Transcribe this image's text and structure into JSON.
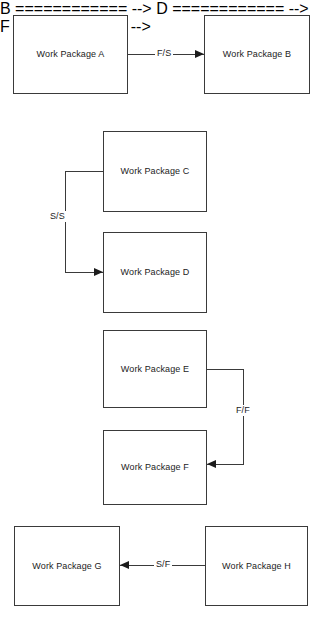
{
  "diagram": {
    "type": "dependency-diagram",
    "background_color": "#ffffff",
    "node_border_color": "#3a3a3a",
    "connector_color": "#3a3a3a",
    "text_color": "#1c1c1c",
    "nodes": [
      {
        "id": "a",
        "label": "Work Package A",
        "x": 13,
        "y": 15,
        "w": 115,
        "h": 79
      },
      {
        "id": "b",
        "label": "Work Package B",
        "x": 204,
        "y": 15,
        "w": 106,
        "h": 79
      },
      {
        "id": "c",
        "label": "Work Package C",
        "x": 103,
        "y": 131,
        "w": 104,
        "h": 81
      },
      {
        "id": "d",
        "label": "Work Package D",
        "x": 103,
        "y": 232,
        "w": 104,
        "h": 81
      },
      {
        "id": "e",
        "label": "Work Package E",
        "x": 103,
        "y": 330,
        "w": 104,
        "h": 78
      },
      {
        "id": "f",
        "label": "Work Package F",
        "x": 103,
        "y": 430,
        "w": 104,
        "h": 75
      },
      {
        "id": "g",
        "label": "Work Package G",
        "x": 14,
        "y": 526,
        "w": 106,
        "h": 80
      },
      {
        "id": "h",
        "label": "Work Package H",
        "x": 205,
        "y": 526,
        "w": 103,
        "h": 80
      }
    ],
    "connections": [
      {
        "id": "ab",
        "label": "F/S",
        "from": "a",
        "to": "b",
        "from_side": "right",
        "to_side": "left",
        "arrow_direction": "right"
      },
      {
        "id": "cd",
        "label": "S/S",
        "from": "c",
        "to": "d",
        "from_side": "left",
        "to_side": "left",
        "arrow_direction": "right"
      },
      {
        "id": "ef",
        "label": "F/F",
        "from": "e",
        "to": "f",
        "from_side": "right",
        "to_side": "right",
        "arrow_direction": "left"
      },
      {
        "id": "gh",
        "label": "S/F",
        "from": "h",
        "to": "g",
        "from_side": "left",
        "to_side": "right",
        "arrow_direction": "left"
      }
    ],
    "ghost_marks": [
      {
        "id": "m1",
        "text": "·",
        "x": 47,
        "y": 1
      },
      {
        "id": "m2",
        "text": "·",
        "x": 127,
        "y": 1
      }
    ]
  }
}
